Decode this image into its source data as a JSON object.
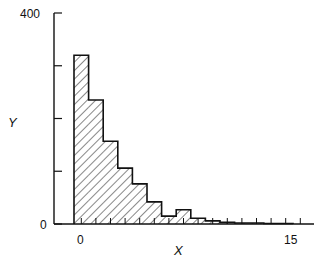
{
  "chart_data": {
    "type": "bar",
    "subtype": "histogram",
    "title": "",
    "xlabel": "X",
    "ylabel": "Y",
    "xlim": [
      0,
      16
    ],
    "ylim": [
      0,
      400
    ],
    "x_ticks": [
      0,
      15
    ],
    "x_tick_labels": [
      "0",
      "15"
    ],
    "y_ticks": [
      0,
      100,
      200,
      300,
      400
    ],
    "y_tick_labels": [
      "0",
      "",
      "",
      "",
      "400"
    ],
    "bin_width": 1,
    "categories": [
      0,
      1,
      2,
      3,
      4,
      5,
      6,
      7,
      8,
      9,
      10,
      11,
      12,
      13,
      14
    ],
    "values": [
      320,
      235,
      157,
      106,
      76,
      42,
      15,
      27,
      11,
      6,
      3,
      2,
      2,
      1,
      1
    ],
    "fill": "diagonal-hatch",
    "grid": false,
    "legend": null
  },
  "labels": {
    "y_top": "400",
    "y_zero": "0",
    "x_zero": "0",
    "x_end": "15",
    "x_axis": "X",
    "y_axis": "Y"
  }
}
